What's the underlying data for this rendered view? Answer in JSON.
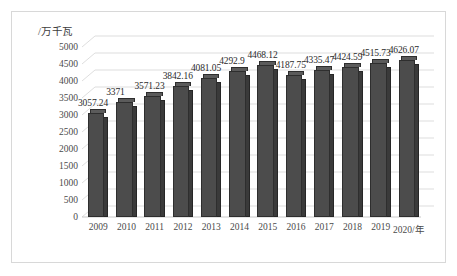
{
  "figure": {
    "y_axis_caption": "/万千瓦",
    "background_color": "#ffffff",
    "frame_color": "#d8d8d8",
    "bar_color": "#4c4c4c",
    "bar_side_color": "#3a3a3a",
    "bar_top_color": "#5b5b5b",
    "gridline_color": "#d9d9d9",
    "text_color": "#3a3a3a"
  },
  "chart_data": {
    "type": "bar",
    "title": "",
    "subtitle": "",
    "xlabel": "/年",
    "ylabel": "/万千瓦",
    "categories": [
      "2009",
      "2010",
      "2011",
      "2012",
      "2013",
      "2014",
      "2015",
      "2016",
      "2017",
      "2018",
      "2019",
      "2020/年"
    ],
    "values": [
      3057.24,
      3371,
      3571.23,
      3842.16,
      4081.05,
      4292.9,
      4468.12,
      4187.75,
      4335.47,
      4424.59,
      4515.73,
      4626.07
    ],
    "data_labels": [
      "3057.24",
      "3371",
      "3571.23",
      "3842.16",
      "4081.05",
      "4292.9",
      "4468.12",
      "4187.75",
      "4335.47",
      "4424.59",
      "4515.73",
      "4626.07"
    ],
    "ylim": [
      0,
      5000
    ],
    "y_ticks": [
      0,
      500,
      1000,
      1500,
      2000,
      2500,
      3000,
      3500,
      4000,
      4500,
      5000
    ],
    "y_tick_labels": [
      "0",
      "500",
      "1000",
      "1500",
      "2000",
      "2500",
      "3000",
      "3500",
      "4000",
      "4500",
      "5000"
    ],
    "grid": true,
    "grid_axis": "y",
    "legend": false,
    "legend_position": "none",
    "three_d": true,
    "series": [
      {
        "name": "装机容量",
        "values": [
          3057.24,
          3371,
          3571.23,
          3842.16,
          4081.05,
          4292.9,
          4468.12,
          4187.75,
          4335.47,
          4424.59,
          4515.73,
          4626.07
        ]
      }
    ]
  }
}
